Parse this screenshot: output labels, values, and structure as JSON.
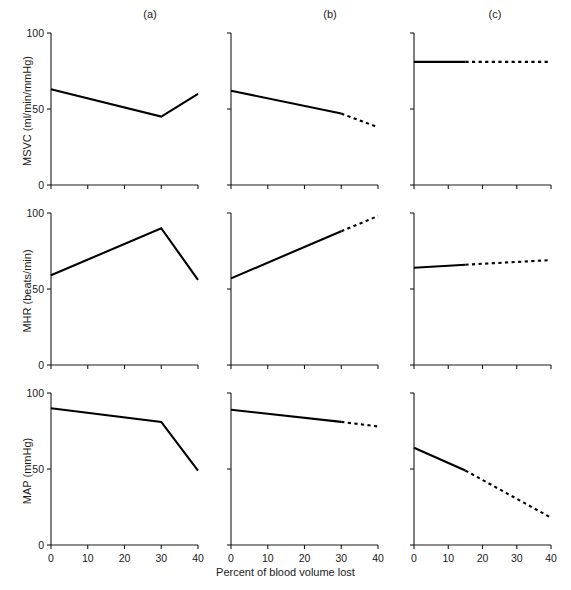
{
  "figure": {
    "xlabel": "Percent of blood volume lost",
    "column_labels": [
      "(a)",
      "(b)",
      "(c)"
    ],
    "row_ylabels": [
      "MSVC (ml/min/mmHg)",
      "MHR (beats/min)",
      "MAP (mmHg)"
    ],
    "xticklabels": [
      "0",
      "10",
      "20",
      "30",
      "40"
    ],
    "yticklabels": [
      "0",
      "50",
      "100"
    ]
  },
  "chart_data": [
    {
      "type": "line",
      "panel": "(a)",
      "row": "MSVC",
      "title": "(a)",
      "xlabel": "Percent of blood volume lost",
      "ylabel": "MSVC (ml/min/mmHg)",
      "xlim": [
        0,
        40
      ],
      "ylim": [
        0,
        100
      ],
      "xticks": [
        0,
        10,
        20,
        30,
        40
      ],
      "yticks": [
        0,
        50,
        100
      ],
      "grid": false,
      "legend": "none",
      "series": [
        {
          "name": "MSVC measured",
          "style": "solid",
          "x": [
            0,
            30,
            40
          ],
          "y": [
            63,
            45,
            60
          ]
        }
      ]
    },
    {
      "type": "line",
      "panel": "(b)",
      "row": "MSVC",
      "title": "(b)",
      "xlabel": "Percent of blood volume lost",
      "ylabel": "MSVC (ml/min/mmHg)",
      "xlim": [
        0,
        40
      ],
      "ylim": [
        0,
        100
      ],
      "xticks": [
        0,
        10,
        20,
        30,
        40
      ],
      "yticks": [
        0,
        50,
        100
      ],
      "grid": false,
      "legend": "none",
      "series": [
        {
          "name": "MSVC measured",
          "style": "solid",
          "x": [
            0,
            30
          ],
          "y": [
            62,
            47
          ]
        },
        {
          "name": "MSVC extrapolated",
          "style": "dashed",
          "x": [
            30,
            40
          ],
          "y": [
            47,
            38
          ]
        }
      ]
    },
    {
      "type": "line",
      "panel": "(c)",
      "row": "MSVC",
      "title": "(c)",
      "xlabel": "Percent of blood volume lost",
      "ylabel": "MSVC (ml/min/mmHg)",
      "xlim": [
        0,
        40
      ],
      "ylim": [
        0,
        100
      ],
      "xticks": [
        0,
        10,
        20,
        30,
        40
      ],
      "yticks": [
        0,
        50,
        100
      ],
      "grid": false,
      "legend": "none",
      "series": [
        {
          "name": "MSVC measured",
          "style": "solid",
          "x": [
            0,
            15
          ],
          "y": [
            81,
            81
          ]
        },
        {
          "name": "MSVC extrapolated",
          "style": "dashed",
          "x": [
            15,
            40
          ],
          "y": [
            81,
            81
          ]
        }
      ]
    },
    {
      "type": "line",
      "panel": "(a)",
      "row": "MHR",
      "title": "(a)",
      "xlabel": "Percent of blood volume lost",
      "ylabel": "MHR (beats/min)",
      "xlim": [
        0,
        40
      ],
      "ylim": [
        0,
        100
      ],
      "xticks": [
        0,
        10,
        20,
        30,
        40
      ],
      "yticks": [
        0,
        50,
        100
      ],
      "grid": false,
      "legend": "none",
      "series": [
        {
          "name": "MHR measured",
          "style": "solid",
          "x": [
            0,
            30,
            40
          ],
          "y": [
            59,
            90,
            56
          ]
        }
      ]
    },
    {
      "type": "line",
      "panel": "(b)",
      "row": "MHR",
      "title": "(b)",
      "xlabel": "Percent of blood volume lost",
      "ylabel": "MHR (beats/min)",
      "xlim": [
        0,
        40
      ],
      "ylim": [
        0,
        100
      ],
      "xticks": [
        0,
        10,
        20,
        30,
        40
      ],
      "yticks": [
        0,
        50,
        100
      ],
      "grid": false,
      "legend": "none",
      "series": [
        {
          "name": "MHR measured",
          "style": "solid",
          "x": [
            0,
            30
          ],
          "y": [
            57,
            88
          ]
        },
        {
          "name": "MHR extrapolated",
          "style": "dashed",
          "x": [
            30,
            40
          ],
          "y": [
            88,
            98
          ]
        }
      ]
    },
    {
      "type": "line",
      "panel": "(c)",
      "row": "MHR",
      "title": "(c)",
      "xlabel": "Percent of blood volume lost",
      "ylabel": "MHR (beats/min)",
      "xlim": [
        0,
        40
      ],
      "ylim": [
        0,
        100
      ],
      "xticks": [
        0,
        10,
        20,
        30,
        40
      ],
      "yticks": [
        0,
        50,
        100
      ],
      "grid": false,
      "legend": "none",
      "series": [
        {
          "name": "MHR measured",
          "style": "solid",
          "x": [
            0,
            15
          ],
          "y": [
            64,
            66
          ]
        },
        {
          "name": "MHR extrapolated",
          "style": "dashed",
          "x": [
            15,
            40
          ],
          "y": [
            66,
            69
          ]
        }
      ]
    },
    {
      "type": "line",
      "panel": "(a)",
      "row": "MAP",
      "title": "(a)",
      "xlabel": "Percent of blood volume lost",
      "ylabel": "MAP (mmHg)",
      "xlim": [
        0,
        40
      ],
      "ylim": [
        0,
        100
      ],
      "xticks": [
        0,
        10,
        20,
        30,
        40
      ],
      "yticks": [
        0,
        50,
        100
      ],
      "grid": false,
      "legend": "none",
      "series": [
        {
          "name": "MAP measured",
          "style": "solid",
          "x": [
            0,
            30,
            40
          ],
          "y": [
            90,
            81,
            49
          ]
        }
      ]
    },
    {
      "type": "line",
      "panel": "(b)",
      "row": "MAP",
      "title": "(b)",
      "xlabel": "Percent of blood volume lost",
      "ylabel": "MAP (mmHg)",
      "xlim": [
        0,
        40
      ],
      "ylim": [
        0,
        100
      ],
      "xticks": [
        0,
        10,
        20,
        30,
        40
      ],
      "yticks": [
        0,
        50,
        100
      ],
      "grid": false,
      "legend": "none",
      "series": [
        {
          "name": "MAP measured",
          "style": "solid",
          "x": [
            0,
            30
          ],
          "y": [
            89,
            81
          ]
        },
        {
          "name": "MAP extrapolated",
          "style": "dashed",
          "x": [
            30,
            40
          ],
          "y": [
            81,
            78
          ]
        }
      ]
    },
    {
      "type": "line",
      "panel": "(c)",
      "row": "MAP",
      "title": "(c)",
      "xlabel": "Percent of blood volume lost",
      "ylabel": "MAP (mmHg)",
      "xlim": [
        0,
        40
      ],
      "ylim": [
        0,
        100
      ],
      "xticks": [
        0,
        10,
        20,
        30,
        40
      ],
      "yticks": [
        0,
        50,
        100
      ],
      "grid": false,
      "legend": "none",
      "series": [
        {
          "name": "MAP measured",
          "style": "solid",
          "x": [
            0,
            15
          ],
          "y": [
            64,
            49
          ]
        },
        {
          "name": "MAP extrapolated",
          "style": "dashed",
          "x": [
            15,
            40
          ],
          "y": [
            49,
            18
          ]
        }
      ]
    }
  ]
}
